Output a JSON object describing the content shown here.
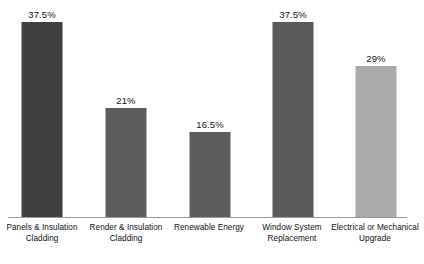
{
  "chart_data": {
    "type": "bar",
    "title": "",
    "subtitle": "",
    "xlabel": "",
    "ylabel": "",
    "grid": false,
    "legend": false,
    "ylim": [
      0,
      42
    ],
    "categories": [
      "Panels & Insulation Cladding",
      "Render & Insulation Cladding",
      "Renewable Energy",
      "Window System Replacement",
      "Electrical or Mechanical Upgrade"
    ],
    "values": [
      37.5,
      21,
      16.5,
      37.5,
      29
    ],
    "value_labels": [
      "37.5%",
      "21%",
      "16.5%",
      "37.5%",
      "29%"
    ],
    "bars": [
      {
        "label_line1": "Panels & Insulation",
        "label_line2": "Cladding",
        "value": 37.5,
        "value_label": "37.5%",
        "color": "#403f41"
      },
      {
        "label_line1": "Render & Insulation",
        "label_line2": "Cladding",
        "value": 21,
        "value_label": "21%",
        "color": "#5c5c5c"
      },
      {
        "label_line1": "Renewable Energy",
        "label_line2": "",
        "value": 16.5,
        "value_label": "16.5%",
        "color": "#5d5d5d"
      },
      {
        "label_line1": "Window System",
        "label_line2": "Replacement",
        "value": 37.5,
        "value_label": "37.5%",
        "color": "#5a5a5a"
      },
      {
        "label_line1": "Electrical or Mechanical",
        "label_line2": "Upgrade",
        "value": 29,
        "value_label": "29%",
        "color": "#aaaaaa"
      }
    ],
    "colors": {
      "axis": "#9a9a9a",
      "text": "#111111",
      "background": "#ffffff"
    }
  }
}
